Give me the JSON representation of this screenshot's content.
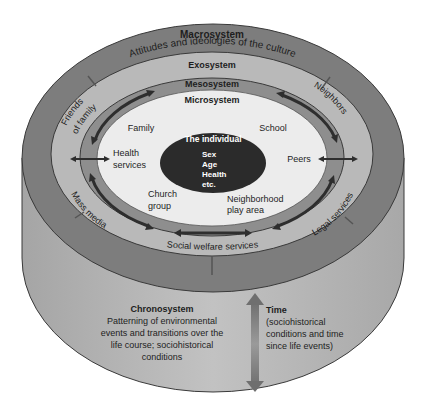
{
  "diagram": {
    "colors": {
      "cylinder_side": "#b3b3b3",
      "macro_ring": "#7d7d7d",
      "exo_ring": "#b9b9b9",
      "meso_ring": "#8e8e8e",
      "micro_core": "#ececec",
      "individual": "#2b2b2b",
      "text": "#1e1e1e",
      "outline": "#3a3a3a"
    },
    "macrosystem": {
      "label": "Macrosystem",
      "description": "Attitudes and ideologies of the culture"
    },
    "exosystem": {
      "label": "Exosystem",
      "items": [
        "Friends of family",
        "Neighbors",
        "Mass media",
        "Legal services",
        "Social welfare services"
      ]
    },
    "mesosystem": {
      "label": "Mesosystem"
    },
    "microsystem": {
      "label": "Microsystem",
      "items": [
        "Family",
        "School",
        "Health",
        "services",
        "Peers",
        "Church",
        "group",
        "Neighborhood",
        "play area"
      ]
    },
    "individual": {
      "title": "The individual",
      "traits": [
        "Sex",
        "Age",
        "Health",
        "etc."
      ]
    },
    "chronosystem": {
      "label": "Chronosystem",
      "description_lines": [
        "Patterning of environmental",
        "events and transitions over the",
        "life course; sociohistorical",
        "conditions"
      ]
    },
    "time": {
      "label": "Time",
      "description_lines": [
        "(sociohistorical",
        "conditions and time",
        "since life events)"
      ]
    }
  }
}
